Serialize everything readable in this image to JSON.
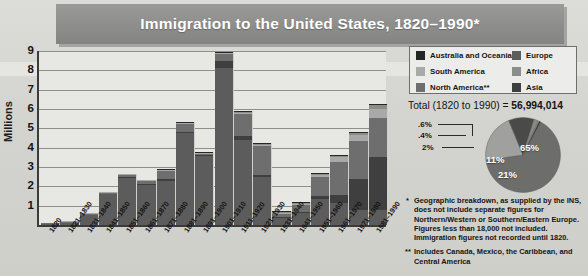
{
  "title": "Immigration to the United States, 1820–1990*",
  "chart_data": [
    {
      "type": "bar",
      "title": "Immigration to the United States, 1820–1990*",
      "ylabel": "Millions",
      "xlabel": "",
      "ylim": [
        0,
        9
      ],
      "yticks": [
        "9",
        "8",
        "7",
        "6",
        "5",
        "4",
        "3",
        "2",
        "1"
      ],
      "grid": true,
      "stacked": true,
      "categories": [
        "1820",
        "1821–1830",
        "1831–1840",
        "1841–1850",
        "1851–1860",
        "1861–1870",
        "1871–1880",
        "1881–1890",
        "1891–1900",
        "1901–1910",
        "1911–1920",
        "1921–1930",
        "1931–1940",
        "1941–1950",
        "1951–1960",
        "1961–1970",
        "1971–1980",
        "1981–1990"
      ],
      "series": [
        {
          "name": "Europe",
          "color": "#5c5c5c",
          "values": [
            0.008,
            0.099,
            0.495,
            1.597,
            2.452,
            2.065,
            2.272,
            4.735,
            3.556,
            8.136,
            4.376,
            2.477,
            0.348,
            0.621,
            1.326,
            1.123,
            0.8,
            0.762
          ]
        },
        {
          "name": "Asia",
          "color": "#3f3f3f",
          "values": [
            0,
            0,
            0,
            0,
            0.042,
            0.065,
            0.124,
            0.069,
            0.075,
            0.324,
            0.247,
            0.112,
            0.016,
            0.032,
            0.15,
            0.428,
            1.588,
            2.738
          ]
        },
        {
          "name": "North America**",
          "color": "#6e6e6e",
          "values": [
            0.002,
            0.012,
            0.033,
            0.062,
            0.075,
            0.167,
            0.404,
            0.427,
            0.039,
            0.362,
            1.144,
            1.517,
            0.16,
            0.355,
            0.997,
            1.716,
            1.983,
            2.058
          ]
        },
        {
          "name": "South America",
          "color": "#a9a9a7",
          "values": [
            0,
            0.003,
            0.008,
            0.003,
            0.001,
            0.001,
            0.002,
            0.002,
            0.001,
            0.017,
            0.041,
            0.042,
            0.007,
            0.021,
            0.091,
            0.257,
            0.296,
            0.462
          ]
        },
        {
          "name": "Africa",
          "color": "#8c8c8a",
          "values": [
            0,
            0,
            0,
            0,
            0,
            0,
            0,
            0,
            0,
            0,
            0.008,
            0.006,
            0.002,
            0.007,
            0.014,
            0.029,
            0.081,
            0.177
          ]
        },
        {
          "name": "Australia and Oceania",
          "color": "#262626",
          "values": [
            0,
            0,
            0,
            0,
            0,
            0,
            0.01,
            0.013,
            0.013,
            0.013,
            0.013,
            0.025,
            0.003,
            0.015,
            0.013,
            0.025,
            0.042,
            0.046
          ]
        }
      ]
    },
    {
      "type": "pie",
      "title": "Total (1820 to 1990) = 56,994,014",
      "labels": [
        "Europe",
        "North America**",
        "Asia",
        "South America",
        "Africa",
        "Australia and Oceania"
      ],
      "values": [
        65,
        21,
        11,
        2,
        0.4,
        0.6
      ],
      "display_labels": [
        "65%",
        "21%",
        "11%",
        "2%",
        ".4%",
        ".6%"
      ],
      "colors": [
        "#6d6d6b",
        "#a0a09e",
        "#4a4a48",
        "#888886",
        "#b4b4b2",
        "#2c2c2a"
      ],
      "legend": "right"
    }
  ],
  "axes": {
    "ylabel": "Millions",
    "yticks": [
      "9",
      "8",
      "7",
      "6",
      "5",
      "4",
      "3",
      "2",
      "1"
    ],
    "xticks": [
      "1820",
      "1821–1830",
      "1831–1840",
      "1841–1850",
      "1851–1860",
      "1861–1870",
      "1871–1880",
      "1881–1890",
      "1891–1900",
      "1901–1910",
      "1911–1920",
      "1921–1930",
      "1931–1940",
      "1941–1950",
      "1951–1960",
      "1961–1970",
      "1971–1980",
      "1981–1990"
    ]
  },
  "legend": {
    "items": [
      {
        "label": "Australia and Oceania",
        "color": "#262626"
      },
      {
        "label": "Europe",
        "color": "#5c5c5c"
      },
      {
        "label": "South America",
        "color": "#a9a9a7"
      },
      {
        "label": "Africa",
        "color": "#8c8c8a"
      },
      {
        "label": "North America**",
        "color": "#6e6e6e"
      },
      {
        "label": "Asia",
        "color": "#3f3f3f"
      }
    ]
  },
  "total": {
    "label": "Total (1820 to 1990) = ",
    "value": "56,994,014"
  },
  "pie": {
    "slices": [
      {
        "label": "65%",
        "value": 65,
        "color": "#6d6d6b"
      },
      {
        "label": "21%",
        "value": 21,
        "color": "#a0a09e"
      },
      {
        "label": "11%",
        "value": 11,
        "color": "#4a4a48"
      },
      {
        "label": "2%",
        "value": 2,
        "color": "#888886"
      },
      {
        "label": ".4%",
        "value": 0.4,
        "color": "#b4b4b2"
      },
      {
        "label": ".6%",
        "value": 0.6,
        "color": "#2c2c2a"
      }
    ],
    "callouts": [
      ".6%",
      ".4%",
      "2%"
    ],
    "inner": [
      "65%",
      "21%",
      "11%"
    ]
  },
  "notes": {
    "single_mark": "*",
    "single": "Geographic breakdown, as supplied by the INS, does not include separate figures for Northern/Western or Southern/Eastern Europe. Figures less than 18,000 not included. Immigration figures not recorded until 1820.",
    "double_mark": "**",
    "double": "Includes Canada, Mexico, the Caribbean, and Central America"
  }
}
